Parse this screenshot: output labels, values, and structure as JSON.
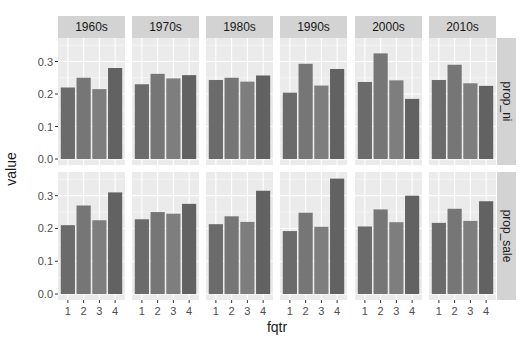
{
  "chart_data": {
    "type": "bar",
    "title": "",
    "xlabel": "fqtr",
    "ylabel": "value",
    "facet_cols": [
      "1960s",
      "1970s",
      "1980s",
      "1990s",
      "2000s",
      "2010s"
    ],
    "facet_rows": [
      "prop_ni",
      "prop_sale"
    ],
    "categories": [
      "1",
      "2",
      "3",
      "4"
    ],
    "ylim": [
      0,
      0.36
    ],
    "yticks": [
      0.0,
      0.1,
      0.2,
      0.3
    ],
    "ytick_labels": [
      "0.0",
      "0.1",
      "0.2",
      "0.3"
    ],
    "grid": true,
    "legend": "none",
    "panels": [
      {
        "row": "prop_ni",
        "col": "1960s",
        "values": [
          0.22,
          0.25,
          0.215,
          0.28
        ]
      },
      {
        "row": "prop_ni",
        "col": "1970s",
        "values": [
          0.23,
          0.262,
          0.248,
          0.258
        ]
      },
      {
        "row": "prop_ni",
        "col": "1980s",
        "values": [
          0.243,
          0.25,
          0.238,
          0.257
        ]
      },
      {
        "row": "prop_ni",
        "col": "1990s",
        "values": [
          0.204,
          0.293,
          0.226,
          0.277
        ]
      },
      {
        "row": "prop_ni",
        "col": "2000s",
        "values": [
          0.237,
          0.325,
          0.242,
          0.185
        ]
      },
      {
        "row": "prop_ni",
        "col": "2010s",
        "values": [
          0.243,
          0.29,
          0.233,
          0.225
        ]
      },
      {
        "row": "prop_sale",
        "col": "1960s",
        "values": [
          0.21,
          0.27,
          0.225,
          0.31
        ]
      },
      {
        "row": "prop_sale",
        "col": "1970s",
        "values": [
          0.228,
          0.25,
          0.245,
          0.275
        ]
      },
      {
        "row": "prop_sale",
        "col": "1980s",
        "values": [
          0.213,
          0.237,
          0.22,
          0.315
        ]
      },
      {
        "row": "prop_sale",
        "col": "1990s",
        "values": [
          0.192,
          0.248,
          0.205,
          0.352
        ]
      },
      {
        "row": "prop_sale",
        "col": "2000s",
        "values": [
          0.206,
          0.258,
          0.219,
          0.3
        ]
      },
      {
        "row": "prop_sale",
        "col": "2010s",
        "values": [
          0.217,
          0.26,
          0.223,
          0.283
        ]
      }
    ],
    "colors": {
      "bar_fqtr": [
        "#6b6b6b",
        "#767676",
        "#7e7e7e",
        "#626262"
      ],
      "panel_bg": "#ebebeb",
      "grid": "#ffffff",
      "strip_bg": "#d3d3d3",
      "text": "#4d4d4d",
      "axis_title": "#1a1a1a"
    }
  }
}
